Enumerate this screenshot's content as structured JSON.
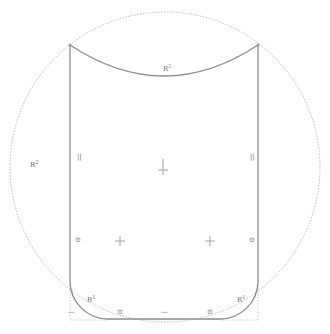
{
  "diagram": {
    "type": "cad-sketch",
    "colors": {
      "profile": "#8a8a8a",
      "construction": "#b4b4b4",
      "annotation": "#6f6f6f",
      "background": "#ffffff"
    },
    "construction_circle": {
      "cx": 165,
      "cy": 167,
      "r": 155
    },
    "profile": {
      "left_x": 70,
      "right_x": 258,
      "top_y": 45,
      "top_arc_sag_y": 76,
      "bottom_y": 319,
      "fillet_r": 38
    },
    "annotations": [
      {
        "id": "top-arc-radius",
        "text": "R",
        "sup": "2",
        "x": 163,
        "y": 64
      },
      {
        "id": "circle-radius",
        "text": "R",
        "sup": "2",
        "x": 30,
        "y": 160
      },
      {
        "id": "parallel-left",
        "text": "||",
        "x": 77,
        "y": 154
      },
      {
        "id": "parallel-right",
        "text": "||",
        "x": 250,
        "y": 154
      },
      {
        "id": "fillet-left",
        "text": "R",
        "sup": "1",
        "x": 87,
        "y": 295
      },
      {
        "id": "fillet-right",
        "text": "R",
        "sup": "1",
        "x": 237,
        "y": 295
      },
      {
        "id": "tangent-left-top",
        "text": "⊙",
        "x": 75,
        "y": 237
      },
      {
        "id": "tangent-right-top",
        "text": "⊙",
        "x": 249,
        "y": 237
      },
      {
        "id": "tangent-left-bottom",
        "text": "⊙",
        "x": 117,
        "y": 309
      },
      {
        "id": "tangent-right-bottom",
        "text": "⊙",
        "x": 207,
        "y": 309
      },
      {
        "id": "horizontal-bottom",
        "text": "—",
        "x": 161,
        "y": 309
      },
      {
        "id": "horizontal-bottom-left",
        "text": "—",
        "x": 68,
        "y": 309
      }
    ],
    "center_markers": [
      {
        "id": "center-main",
        "x": 163,
        "y": 167
      },
      {
        "id": "center-fillet-left",
        "x": 120,
        "y": 241
      },
      {
        "id": "center-fillet-right",
        "x": 210,
        "y": 241
      }
    ],
    "corner_points": [
      {
        "id": "top-left-vertex",
        "x": 70,
        "y": 45
      },
      {
        "id": "top-right-vertex",
        "x": 258,
        "y": 45
      }
    ]
  }
}
